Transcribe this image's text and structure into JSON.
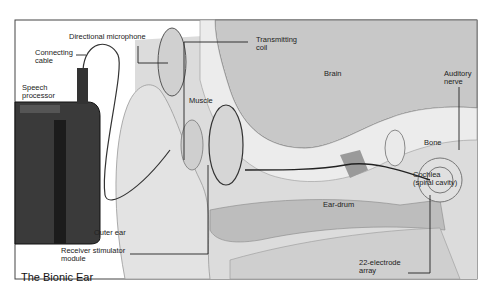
{
  "figure": {
    "title": "The Bionic Ear",
    "labels": {
      "directional_microphone": "Directional microphone",
      "connecting_cable": "Connecting\ncable",
      "speech_processor": "Speech\nprocessor",
      "transmitting_coil": "Transmitting\ncoil",
      "brain": "Brain",
      "auditory_nerve": "Auditory\nnerve",
      "muscle": "Muscle",
      "bone": "Bone",
      "cochlea": "Cochlea\n(spiral cavity)",
      "ear_drum": "Ear-drum",
      "outer_ear": "Outer ear",
      "receiver_stimulator_module": "Receiver stimulator\nmodule",
      "electrode_array": "22-electrode\narray"
    }
  },
  "colors": {
    "background": "#ffffff",
    "frame": "#333333",
    "brain": "#cfcfcf",
    "bone": "#e8e8e8",
    "device_dark": "#2b2b2b",
    "skin": "#d9d9d9"
  }
}
